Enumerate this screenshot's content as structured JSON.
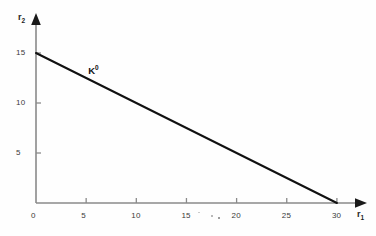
{
  "figure": {
    "background_color": "#fefefe",
    "axis_color": "#8a8a8a",
    "arrow_color": "#1a1a1a",
    "line_color": "#111111",
    "tick_text_color": "#3a3a3a"
  },
  "chart_data": {
    "type": "line",
    "title": "",
    "xlabel": "r1",
    "ylabel": "r2",
    "xlabel_display": "r",
    "xlabel_sub": "1",
    "ylabel_display": "r",
    "ylabel_sub": "2",
    "xlim": [
      0,
      31.5
    ],
    "ylim": [
      0,
      16.5
    ],
    "grid": false,
    "legend": "none",
    "xticks": [
      0,
      5,
      10,
      15,
      20,
      25,
      30
    ],
    "xtick_labels": [
      "0",
      "5",
      "10",
      "15",
      "20",
      "25",
      "30"
    ],
    "yticks": [
      5,
      10,
      15
    ],
    "ytick_labels": [
      "5",
      "10",
      "15"
    ],
    "origin_label": "0",
    "series": [
      {
        "name": "K0",
        "label_text": "K",
        "label_sup": "0",
        "x": [
          0,
          30
        ],
        "y": [
          15,
          0
        ],
        "intercept_y": 15,
        "intercept_x": 30,
        "slope": -0.5
      }
    ],
    "annotations": [
      {
        "name": "isoquant-label",
        "text": "K",
        "superscript": "0",
        "x": 5.2,
        "y": 13.2
      }
    ],
    "artifacts": [
      {
        "name": "smudge-a",
        "x": 16.2,
        "y": -0.85,
        "size": 1.6,
        "opacity": 0.35
      },
      {
        "name": "smudge-b",
        "x": 17.4,
        "y": -1.15,
        "size": 2.1,
        "opacity": 0.55
      },
      {
        "name": "smudge-c",
        "x": 18.1,
        "y": -1.35,
        "size": 2.8,
        "opacity": 0.8
      }
    ]
  }
}
